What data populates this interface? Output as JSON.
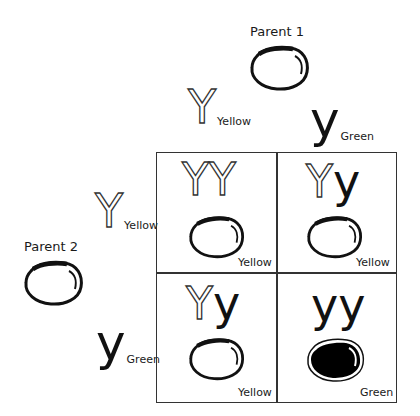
{
  "parents": {
    "parent1": {
      "label": "Parent 1",
      "phenotype": "yellow-pea"
    },
    "parent2": {
      "label": "Parent 2",
      "phenotype": "yellow-pea"
    }
  },
  "parent1_alleles": [
    {
      "letter": "Y",
      "style": "outline",
      "name": "Yellow"
    },
    {
      "letter": "y",
      "style": "solid",
      "name": "Green"
    }
  ],
  "parent2_alleles": [
    {
      "letter": "Y",
      "style": "outline",
      "name": "Yellow"
    },
    {
      "letter": "y",
      "style": "solid",
      "name": "Green"
    }
  ],
  "punnett": {
    "cells": [
      {
        "genotype": [
          "Y",
          "Y"
        ],
        "styles": [
          "outline",
          "outline"
        ],
        "phenotype": "Yellow",
        "pea": "yellow"
      },
      {
        "genotype": [
          "Y",
          "y"
        ],
        "styles": [
          "outline",
          "solid"
        ],
        "phenotype": "Yellow",
        "pea": "yellow"
      },
      {
        "genotype": [
          "Y",
          "y"
        ],
        "styles": [
          "outline",
          "solid"
        ],
        "phenotype": "Yellow",
        "pea": "yellow"
      },
      {
        "genotype": [
          "y",
          "y"
        ],
        "styles": [
          "solid",
          "solid"
        ],
        "phenotype": "Green",
        "pea": "green"
      }
    ]
  },
  "colors": {
    "line": "#333333",
    "text": "#111111",
    "pea_fill_green": "#000000",
    "pea_fill_yellow": "#ffffff"
  }
}
